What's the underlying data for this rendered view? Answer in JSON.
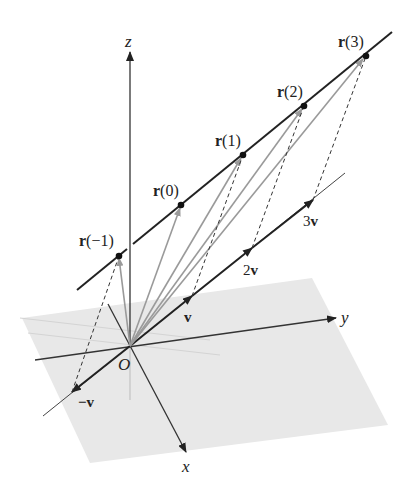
{
  "figure": {
    "axes": {
      "x_label": "x",
      "y_label": "y",
      "z_label": "z",
      "origin_label": "O"
    },
    "line_points": [
      {
        "label_bold": "r",
        "label_rest": "(−1)",
        "x": 119,
        "y": 256
      },
      {
        "label_bold": "r",
        "label_rest": "(0)",
        "x": 181,
        "y": 205
      },
      {
        "label_bold": "r",
        "label_rest": "(1)",
        "x": 243,
        "y": 155
      },
      {
        "label_bold": "r",
        "label_rest": "(2)",
        "x": 304,
        "y": 106
      },
      {
        "label_bold": "r",
        "label_rest": "(3)",
        "x": 366,
        "y": 56
      }
    ],
    "direction_vectors": [
      {
        "label": "−v",
        "multiplier": -1
      },
      {
        "label": "v",
        "multiplier": 1
      },
      {
        "label": "2v",
        "multiplier": 2
      },
      {
        "label": "3v",
        "multiplier": 3
      }
    ],
    "colors": {
      "line": "#222222",
      "position_vectors": "#999999",
      "plane": "#e6e6e6",
      "axes": "#333333",
      "dashed": "#333333"
    }
  }
}
